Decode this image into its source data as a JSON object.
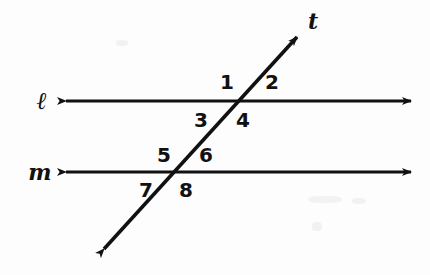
{
  "figure": {
    "background_color": "#fdfdfd",
    "ink_color": "#111111",
    "width": 430,
    "height": 275
  },
  "lines": [
    {
      "id": "line-l",
      "label": "ℓ",
      "kind": "parallel-line",
      "label_x": 42,
      "label_y": 101,
      "x1": 57,
      "y1": 101,
      "x2": 420,
      "y2": 101,
      "arrows": "both"
    },
    {
      "id": "line-m",
      "label": "m",
      "kind": "parallel-line",
      "label_x": 40,
      "label_y": 172,
      "x1": 57,
      "y1": 172,
      "x2": 420,
      "y2": 172,
      "arrows": "both"
    },
    {
      "id": "line-t",
      "label": "t",
      "kind": "transversal",
      "label_x": 313,
      "label_y": 21,
      "x1": 96,
      "y1": 258,
      "x2": 305,
      "y2": 28,
      "arrows": "both"
    }
  ],
  "intersections": [
    {
      "id": "intersection-l-t",
      "x": 238,
      "y": 101
    },
    {
      "id": "intersection-m-t",
      "x": 173,
      "y": 172
    }
  ],
  "angles": [
    {
      "id": "angle-1",
      "label": "1",
      "x": 227,
      "y": 82,
      "position": "upper-left-at-line-l"
    },
    {
      "id": "angle-2",
      "label": "2",
      "x": 272,
      "y": 82,
      "position": "upper-right-at-line-l"
    },
    {
      "id": "angle-3",
      "label": "3",
      "x": 201,
      "y": 120,
      "position": "lower-left-at-line-l"
    },
    {
      "id": "angle-4",
      "label": "4",
      "x": 243,
      "y": 120,
      "position": "lower-right-at-line-l"
    },
    {
      "id": "angle-5",
      "label": "5",
      "x": 164,
      "y": 155,
      "position": "upper-left-at-line-m"
    },
    {
      "id": "angle-6",
      "label": "6",
      "x": 206,
      "y": 155,
      "position": "upper-right-at-line-m"
    },
    {
      "id": "angle-7",
      "label": "7",
      "x": 146,
      "y": 190,
      "position": "lower-left-at-line-m"
    },
    {
      "id": "angle-8",
      "label": "8",
      "x": 186,
      "y": 190,
      "position": "lower-right-at-line-m"
    }
  ]
}
